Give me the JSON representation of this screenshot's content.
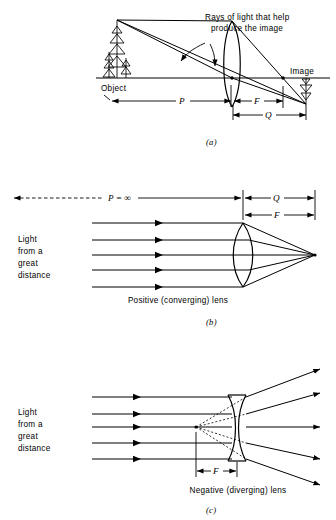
{
  "figure": {
    "panels": [
      {
        "id": "a",
        "caption": "(a)",
        "annotation_line1": "Rays of light that help",
        "annotation_line2": "produce the image",
        "object_label": "Object",
        "image_label": "Image",
        "dim_p": "P",
        "dim_f": "F",
        "dim_q": "Q"
      },
      {
        "id": "b",
        "caption": "(b)",
        "source_line1": "Light",
        "source_line2": "from a",
        "source_line3": "great",
        "source_line4": "distance",
        "lens_label": "Positive (converging) lens",
        "dim_p": "P = ∞",
        "dim_q": "Q",
        "dim_f": "F"
      },
      {
        "id": "c",
        "caption": "(c)",
        "source_line1": "Light",
        "source_line2": "from a",
        "source_line3": "great",
        "source_line4": "distance",
        "lens_label": "Negative (diverging) lens",
        "dim_f": "F"
      }
    ]
  },
  "colors": {
    "ink": "#000000",
    "paper": "#ffffff"
  }
}
